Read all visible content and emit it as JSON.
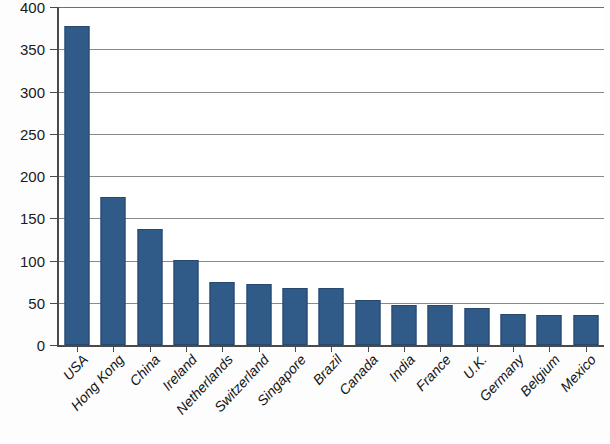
{
  "chart_data": {
    "type": "bar",
    "title": "",
    "subtitle": "",
    "xlabel": "",
    "ylabel": "",
    "ylim": [
      0,
      400
    ],
    "ytick_step": 50,
    "grid": "horizontal",
    "legend": "none",
    "series_name": "",
    "bar_color": "#305a87",
    "bar_border_color": "#27496e",
    "gridline_color": "#8a8a8a",
    "axis_color": "#4a4a4a",
    "categories": [
      "USA",
      "Hong Kong",
      "China",
      "Ireland",
      "Netherlands",
      "Switzerland",
      "Singapore",
      "Brazil",
      "Canada",
      "India",
      "France",
      "U.K.",
      "Germany",
      "Belgium",
      "Mexico"
    ],
    "values": [
      378,
      175,
      137,
      101,
      75,
      72,
      67,
      67,
      53,
      47,
      47,
      44,
      37,
      36,
      35
    ],
    "ytick_labels": [
      "0",
      "50",
      "100",
      "150",
      "200",
      "250",
      "300",
      "350",
      "400"
    ],
    "ytick_values": [
      0,
      50,
      100,
      150,
      200,
      250,
      300,
      350,
      400
    ]
  }
}
